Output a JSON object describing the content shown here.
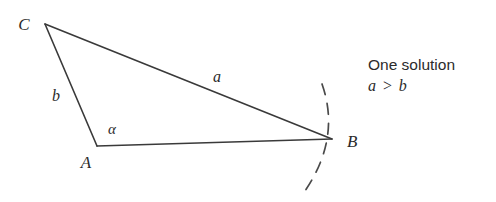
{
  "figure": {
    "kind": "triangle-diagram",
    "background_color": "#ffffff",
    "stroke_color": "#3a3a3a",
    "vertices": {
      "C": {
        "label": "C",
        "x": 45,
        "y": 24,
        "label_x": 24,
        "label_y": 22
      },
      "A": {
        "label": "A",
        "x": 97,
        "y": 146,
        "label_x": 84,
        "label_y": 166
      },
      "B": {
        "label": "B",
        "x": 332,
        "y": 139,
        "label_x": 345,
        "label_y": 146
      }
    },
    "sides": [
      {
        "name": "a",
        "label": "a",
        "from": "C",
        "to": "B",
        "label_x": 217,
        "label_y": 80
      },
      {
        "name": "b",
        "label": "b",
        "from": "C",
        "to": "A",
        "label_x": 55,
        "label_y": 99
      },
      {
        "name": "c",
        "label": "",
        "from": "A",
        "to": "B",
        "label_x": 0,
        "label_y": 0
      }
    ],
    "angles": [
      {
        "name": "alpha",
        "label": "α",
        "at": "A",
        "label_x": 108,
        "label_y": 134
      }
    ],
    "arc": {
      "description": "dashed arc centered at C passing through B",
      "dash_pattern": "11 9",
      "stroke_color": "#4a4a4a"
    }
  },
  "annotation": {
    "line1": "One solution",
    "line2": "a > b",
    "line2_left": "a",
    "line2_operator": ">",
    "line2_right": "b",
    "x": 368,
    "y1": 70,
    "y2": 91
  }
}
